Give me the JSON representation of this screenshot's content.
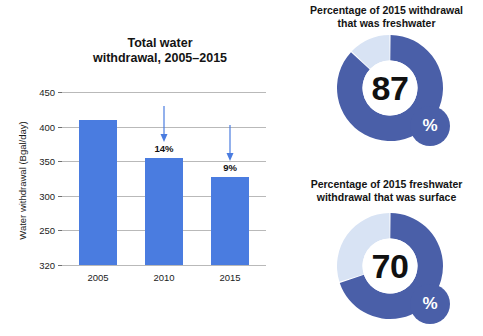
{
  "chart_data": [
    {
      "type": "bar",
      "title": "Total water withdrawal, 2005–2015",
      "title_lines": [
        "Total water",
        "withdrawal, 2005–2015"
      ],
      "xlabel": "",
      "ylabel": "Water withdrawal (Bgal/day)",
      "categories": [
        "2005",
        "2010",
        "2015"
      ],
      "values": [
        410,
        355,
        327
      ],
      "ylim": [
        200,
        450
      ],
      "ytick_labels": [
        "450",
        "400",
        "350",
        "300",
        "250",
        "320"
      ],
      "ytick_values": [
        450,
        400,
        350,
        300,
        250,
        200
      ],
      "grid": true,
      "legend": "none",
      "bar_color": "#4a7ce0",
      "annotations": [
        {
          "category": "2010",
          "label": "14%",
          "marker": "down-arrow"
        },
        {
          "category": "2015",
          "label": "9%",
          "marker": "down-arrow"
        }
      ]
    },
    {
      "type": "pie",
      "subtype": "donut",
      "title": "Percentage of 2015 withdrawal that was freshwater",
      "title_lines": [
        "Percentage of 2015 withdrawal",
        "that was freshwater"
      ],
      "center_value": "87",
      "badge_label": "%",
      "slices": [
        {
          "name": "freshwater",
          "value": 87,
          "color": "#4a5fa8"
        },
        {
          "name": "other",
          "value": 13,
          "color": "#d8e3f4"
        }
      ]
    },
    {
      "type": "pie",
      "subtype": "donut",
      "title": "Percentage of 2015 freshwater withdrawal that was surface",
      "title_lines": [
        "Percentage of 2015 freshwater",
        "withdrawal that was surface"
      ],
      "center_value": "70",
      "badge_label": "%",
      "slices": [
        {
          "name": "surface",
          "value": 70,
          "color": "#4a5fa8"
        },
        {
          "name": "other",
          "value": 30,
          "color": "#d8e3f4"
        }
      ]
    }
  ],
  "colors": {
    "bar_blue": "#4a7ce0",
    "donut_dark_blue": "#4a5fa8",
    "donut_light_blue": "#d8e3f4",
    "gridline": "#b9b9b9",
    "text": "#1c1c1c",
    "background": "#ffffff"
  }
}
